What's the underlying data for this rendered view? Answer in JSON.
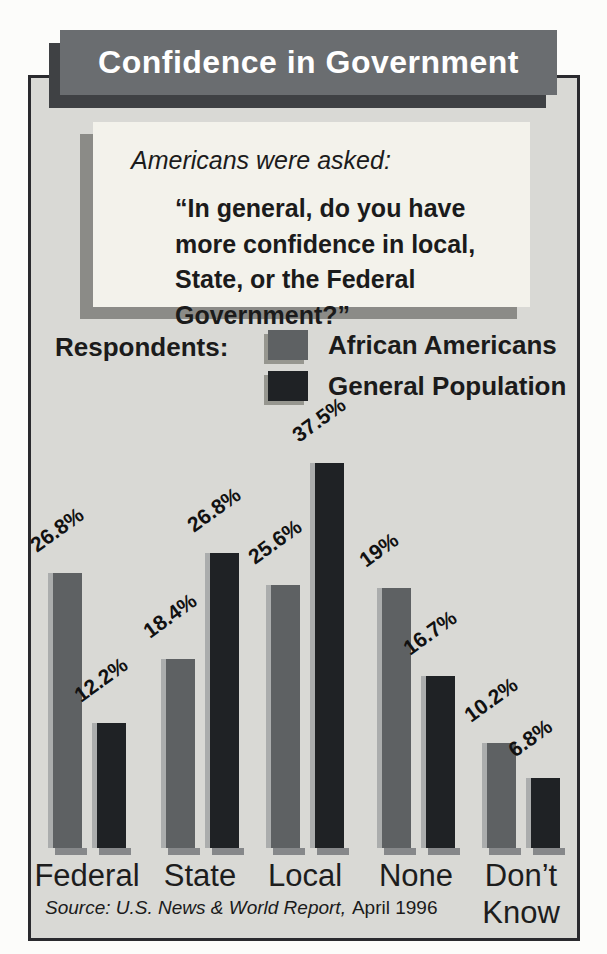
{
  "title_banner": {
    "text": "Confidence in Government"
  },
  "question_box": {
    "intro": "Americans were asked:",
    "quote": "“In general, do you have more confidence in local, State, or the Federal Government?”"
  },
  "legend": {
    "heading": "Respondents:",
    "items": [
      {
        "label": "African Americans",
        "color": "#5e6163"
      },
      {
        "label": "General Population",
        "color": "#1f2225"
      }
    ]
  },
  "source": {
    "italic_part": "Source: U.S. News & World Report,",
    "regular_part": "April 1996"
  },
  "colors": {
    "frame_bg": "#d9d9d5",
    "banner_bg": "#6a6d70",
    "banner_shadow": "#3f4144",
    "question_box_bg": "#f3f2eb",
    "box_shadow_gray": "#8b8b87",
    "bar_african_americans": "#5e6163",
    "bar_general_population": "#1f2225",
    "bar_highlight": "#abadad",
    "bar_bottom_shadow": "#86888a"
  },
  "chart_data": {
    "type": "bar",
    "title": "Confidence in Government",
    "categories": [
      "Federal",
      "State",
      "Local",
      "None",
      "Don’t Know"
    ],
    "series": [
      {
        "name": "African Americans",
        "color": "#5e6163",
        "values": [
          26.8,
          18.4,
          25.6,
          19,
          10.2
        ],
        "labels": [
          "26.8%",
          "18.4%",
          "25.6%",
          "19%",
          "10.2%"
        ],
        "drawn_pct": [
          26.8,
          18.4,
          25.6,
          25.3,
          10.2
        ]
      },
      {
        "name": "General Population",
        "color": "#1f2225",
        "values": [
          12.2,
          26.8,
          37.5,
          16.7,
          6.8
        ],
        "labels": [
          "12.2%",
          "26.8%",
          "37.5%",
          "16.7%",
          "6.8%"
        ],
        "drawn_pct": [
          12.2,
          28.7,
          37.5,
          16.7,
          6.8
        ]
      }
    ],
    "unit": "%",
    "ylim": [
      0,
      40
    ],
    "grid": false,
    "legend_position": "top",
    "value_label_rotation_deg": -36,
    "note": "drawn_pct records bar heights as actually rendered in the source image; None/AA and State/GP bars are drawn taller than their labeled values."
  }
}
